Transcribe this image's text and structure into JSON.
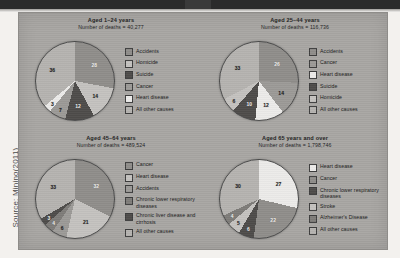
{
  "source_credit": "Source: Minino(2011)",
  "palette": {
    "accidents_gray": "#8f8d8a",
    "mid_gray": "#9c9a97",
    "dark_gray": "#4e4c4a",
    "light_gray": "#c4c2bf",
    "white": "#ecebe9",
    "pale_gray": "#b5b3b0"
  },
  "chart_data": [
    {
      "type": "pie",
      "title": "Aged 1–24 years",
      "subtitle": "Number of deaths = 40,277",
      "categories": [
        "Accidents",
        "Homicide",
        "Suicide",
        "Cancer",
        "Heart disease",
        "All other causes"
      ],
      "values": [
        28,
        14,
        12,
        7,
        3,
        36
      ],
      "colors": [
        "#8f8d8a",
        "#c4c2bf",
        "#4e4c4a",
        "#9c9a97",
        "#ecebe9",
        "#b5b3b0"
      ],
      "unit": "percent",
      "legend_position": "right"
    },
    {
      "type": "pie",
      "title": "Aged 25–44 years",
      "subtitle": "Number of deaths = 116,736",
      "categories": [
        "Accidents",
        "Cancer",
        "Heart disease",
        "Suicide",
        "Homicide",
        "All other causes"
      ],
      "values": [
        26,
        14,
        12,
        10,
        6,
        33
      ],
      "colors": [
        "#8f8d8a",
        "#9c9a97",
        "#ecebe9",
        "#4e4c4a",
        "#c4c2bf",
        "#b5b3b0"
      ],
      "unit": "percent",
      "legend_position": "right"
    },
    {
      "type": "pie",
      "title": "Aged 45–64 years",
      "subtitle": "Number of deaths = 489,524",
      "categories": [
        "Cancer",
        "Heart disease",
        "Accidents",
        "Chronic lower respiratory diseases",
        "Chronic liver disease and cirrhosis",
        "All other causes"
      ],
      "values": [
        32,
        21,
        6,
        4,
        3,
        33
      ],
      "colors": [
        "#8f8d8a",
        "#c4c2bf",
        "#9c9a97",
        "#7e7c79",
        "#4e4c4a",
        "#b5b3b0"
      ],
      "unit": "percent",
      "legend_position": "right"
    },
    {
      "type": "pie",
      "title": "Aged 65 years and over",
      "subtitle": "Number of deaths = 1,798,746",
      "categories": [
        "Heart disease",
        "Cancer",
        "Chronic lower respiratory diseases",
        "Stroke",
        "Alzheimer's Disease",
        "All other causes"
      ],
      "values": [
        27,
        22,
        6,
        5,
        4,
        30
      ],
      "colors": [
        "#ecebe9",
        "#8f8d8a",
        "#4e4c4a",
        "#c4c2bf",
        "#7e7c79",
        "#b5b3b0"
      ],
      "unit": "percent",
      "legend_position": "right"
    }
  ]
}
